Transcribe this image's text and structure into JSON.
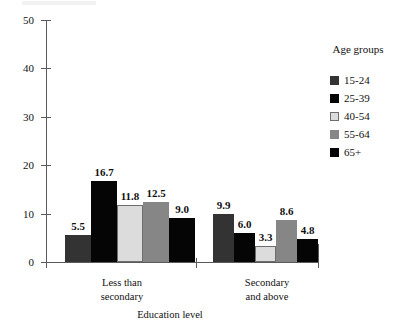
{
  "chart_data": {
    "type": "bar",
    "title": "",
    "xlabel": "Education level",
    "ylabel": "",
    "ylim": [
      0,
      50
    ],
    "yticks": [
      0,
      10,
      20,
      30,
      40,
      50
    ],
    "grid": false,
    "legend_position": "right",
    "legend_title": "Age groups",
    "categories": [
      "Less than secondary",
      "Secondary and above"
    ],
    "category_lines": [
      [
        "Less than",
        "secondary"
      ],
      [
        "Secondary",
        "and above"
      ]
    ],
    "series": [
      {
        "name": "15-24",
        "color": "#333333",
        "values": [
          5.5,
          9.9
        ]
      },
      {
        "name": "25-39",
        "color": "#050505",
        "values": [
          16.7,
          6.0
        ]
      },
      {
        "name": "40-54",
        "color": "#dcdcdc",
        "values": [
          11.8,
          3.3
        ]
      },
      {
        "name": "55-64",
        "color": "#868686",
        "values": [
          8.6,
          8.6
        ]
      },
      {
        "name": "65+",
        "color": "#050505",
        "values": [
          9.0,
          4.8
        ]
      }
    ],
    "data_labels": [
      [
        "5.5",
        "16.7",
        "11.8",
        "12.5",
        "9.0"
      ],
      [
        "9.9",
        "6.0",
        "3.3",
        "8.6",
        "4.8"
      ]
    ],
    "values_by_group": [
      [
        5.5,
        16.7,
        11.8,
        12.5,
        9.0
      ],
      [
        9.9,
        6.0,
        3.3,
        8.6,
        4.8
      ]
    ]
  }
}
